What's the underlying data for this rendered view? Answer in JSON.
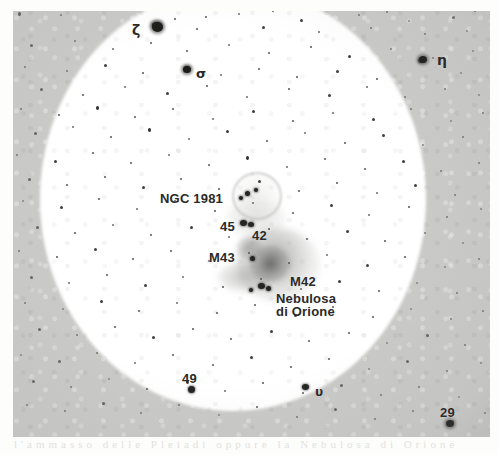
{
  "sheet": {
    "ghost_text": "l'ammasso  delle  Pleiadi   oppure   la  Nebulosa  di  Orione"
  },
  "plate": {
    "caption_labels": [
      {
        "id": "zeta",
        "text": "ζ",
        "x": 132,
        "y": 22,
        "kind": "greek-letter"
      },
      {
        "id": "sigma",
        "text": "σ",
        "x": 196,
        "y": 66,
        "kind": "greek-letter"
      },
      {
        "id": "eta",
        "text": "η",
        "x": 437,
        "y": 52,
        "kind": "greek-letter"
      },
      {
        "id": "ngc1981",
        "text": "NGC 1981",
        "x": 160,
        "y": 191,
        "kind": "object"
      },
      {
        "id": "s45",
        "text": "45",
        "x": 220,
        "y": 219,
        "kind": "star-number"
      },
      {
        "id": "s42",
        "text": "42",
        "x": 252,
        "y": 228,
        "kind": "star-number"
      },
      {
        "id": "m43",
        "text": "M43",
        "x": 209,
        "y": 250,
        "kind": "object"
      },
      {
        "id": "m42",
        "text": "M42",
        "x": 290,
        "y": 275,
        "kind": "object"
      },
      {
        "id": "m42sub1",
        "text": "Nebulosa",
        "x": 276,
        "y": 292,
        "kind": "object"
      },
      {
        "id": "m42sub2",
        "text": "di Orione",
        "x": 276,
        "y": 306,
        "kind": "object"
      },
      {
        "id": "upsilon",
        "text": "υ",
        "x": 315,
        "y": 385,
        "kind": "greek-letter"
      },
      {
        "id": "s49",
        "text": "49",
        "x": 182,
        "y": 371,
        "kind": "star-number"
      },
      {
        "id": "s29",
        "text": "29",
        "x": 440,
        "y": 405,
        "kind": "star-number"
      }
    ],
    "nebulae": [
      {
        "id": "m42-outer",
        "label": "M42 Nebulosa di Orione",
        "x": 236,
        "y": 228,
        "w": 84,
        "h": 74
      },
      {
        "id": "m42-core",
        "label": "M42 core",
        "x": 250,
        "y": 246,
        "w": 40,
        "h": 36
      },
      {
        "id": "m42-wing",
        "label": "M42 western wing",
        "x": 218,
        "y": 262,
        "w": 52,
        "h": 30
      },
      {
        "id": "m43",
        "label": "M43",
        "x": 236,
        "y": 236,
        "w": 26,
        "h": 24
      },
      {
        "id": "ngc1981-halo",
        "label": "NGC 1981 cluster halo",
        "x": 232,
        "y": 172,
        "w": 46,
        "h": 44
      },
      {
        "id": "running-man",
        "label": "NGC 1977 diffuse glow",
        "x": 226,
        "y": 198,
        "w": 60,
        "h": 40
      }
    ],
    "field_note": "Photographic plate of the Orion sword region, overexposed bright field"
  },
  "colors": {
    "sheet_background": "#fdfdfc",
    "plate_sky": "#c9c9c7",
    "bright_field": "#ffffff",
    "star_dark": "#1c1c1a",
    "label_text": "#2a2a28",
    "nebula_gray": "#8a8a88"
  },
  "stars": [
    [
      18,
      12,
      3,
      4
    ],
    [
      60,
      14,
      2,
      2
    ],
    [
      98,
      8,
      2,
      3
    ],
    [
      140,
      9,
      2,
      2
    ],
    [
      174,
      18,
      2,
      2
    ],
    [
      205,
      16,
      2,
      2
    ],
    [
      238,
      13,
      2,
      2
    ],
    [
      272,
      10,
      2,
      2
    ],
    [
      300,
      19,
      3,
      3
    ],
    [
      330,
      9,
      2,
      2
    ],
    [
      358,
      14,
      2,
      2
    ],
    [
      386,
      11,
      2,
      2
    ],
    [
      408,
      20,
      2,
      2
    ],
    [
      452,
      16,
      3,
      3
    ],
    [
      474,
      10,
      2,
      2
    ],
    [
      152,
      22,
      9,
      6
    ],
    [
      196,
      28,
      2,
      2
    ],
    [
      262,
      26,
      3,
      3
    ],
    [
      318,
      31,
      2,
      2
    ],
    [
      370,
      27,
      2,
      2
    ],
    [
      424,
      33,
      2,
      2
    ],
    [
      466,
      30,
      2,
      2
    ],
    [
      30,
      44,
      3,
      3
    ],
    [
      74,
      40,
      2,
      2
    ],
    [
      112,
      48,
      2,
      2
    ],
    [
      150,
      42,
      2,
      2
    ],
    [
      186,
      50,
      2,
      2
    ],
    [
      228,
      44,
      2,
      2
    ],
    [
      268,
      52,
      2,
      2
    ],
    [
      310,
      46,
      2,
      2
    ],
    [
      348,
      55,
      3,
      3
    ],
    [
      390,
      48,
      2,
      2
    ],
    [
      432,
      57,
      2,
      2
    ],
    [
      472,
      50,
      2,
      2
    ],
    [
      24,
      66,
      2,
      2
    ],
    [
      66,
      70,
      2,
      2
    ],
    [
      104,
      64,
      3,
      3
    ],
    [
      142,
      72,
      2,
      2
    ],
    [
      184,
      66,
      6,
      5
    ],
    [
      220,
      74,
      2,
      2
    ],
    [
      258,
      68,
      2,
      2
    ],
    [
      296,
      76,
      2,
      2
    ],
    [
      336,
      70,
      3,
      3
    ],
    [
      376,
      78,
      2,
      2
    ],
    [
      418,
      58,
      6,
      5
    ],
    [
      460,
      72,
      2,
      2
    ],
    [
      40,
      88,
      3,
      3
    ],
    [
      82,
      94,
      2,
      2
    ],
    [
      124,
      86,
      2,
      2
    ],
    [
      166,
      92,
      3,
      3
    ],
    [
      206,
      85,
      2,
      2
    ],
    [
      246,
      96,
      2,
      2
    ],
    [
      288,
      88,
      2,
      2
    ],
    [
      328,
      94,
      3,
      3
    ],
    [
      366,
      86,
      2,
      2
    ],
    [
      404,
      96,
      2,
      2
    ],
    [
      444,
      88,
      2,
      2
    ],
    [
      478,
      94,
      2,
      2
    ],
    [
      20,
      108,
      2,
      2
    ],
    [
      58,
      114,
      2,
      2
    ],
    [
      96,
      106,
      3,
      4
    ],
    [
      134,
      116,
      2,
      2
    ],
    [
      172,
      108,
      2,
      2
    ],
    [
      212,
      118,
      2,
      2
    ],
    [
      252,
      110,
      3,
      3
    ],
    [
      292,
      120,
      2,
      2
    ],
    [
      332,
      112,
      2,
      2
    ],
    [
      372,
      118,
      3,
      3
    ],
    [
      410,
      108,
      2,
      2
    ],
    [
      450,
      120,
      2,
      2
    ],
    [
      482,
      112,
      2,
      2
    ],
    [
      34,
      132,
      3,
      3
    ],
    [
      72,
      126,
      2,
      2
    ],
    [
      110,
      136,
      2,
      2
    ],
    [
      148,
      128,
      3,
      4
    ],
    [
      188,
      138,
      2,
      2
    ],
    [
      226,
      130,
      3,
      3
    ],
    [
      266,
      140,
      2,
      2
    ],
    [
      304,
      132,
      2,
      2
    ],
    [
      344,
      142,
      2,
      2
    ],
    [
      382,
      134,
      3,
      3
    ],
    [
      422,
      144,
      2,
      2
    ],
    [
      462,
      136,
      2,
      2
    ],
    [
      16,
      154,
      2,
      2
    ],
    [
      54,
      160,
      3,
      3
    ],
    [
      92,
      152,
      2,
      2
    ],
    [
      130,
      162,
      2,
      2
    ],
    [
      168,
      154,
      2,
      2
    ],
    [
      208,
      164,
      2,
      2
    ],
    [
      246,
      156,
      3,
      4
    ],
    [
      286,
      166,
      2,
      2
    ],
    [
      324,
      158,
      2,
      2
    ],
    [
      364,
      168,
      2,
      2
    ],
    [
      402,
      160,
      3,
      3
    ],
    [
      440,
      170,
      2,
      2
    ],
    [
      478,
      162,
      2,
      2
    ],
    [
      28,
      178,
      3,
      3
    ],
    [
      66,
      184,
      2,
      2
    ],
    [
      104,
      176,
      2,
      2
    ],
    [
      142,
      186,
      3,
      3
    ],
    [
      180,
      178,
      2,
      2
    ],
    [
      218,
      188,
      2,
      2
    ],
    [
      258,
      180,
      3,
      3
    ],
    [
      298,
      190,
      2,
      2
    ],
    [
      336,
      182,
      2,
      2
    ],
    [
      376,
      192,
      2,
      2
    ],
    [
      414,
      184,
      3,
      3
    ],
    [
      454,
      194,
      2,
      2
    ],
    [
      22,
      200,
      2,
      2
    ],
    [
      60,
      206,
      3,
      3
    ],
    [
      98,
      198,
      2,
      2
    ],
    [
      136,
      208,
      2,
      2
    ],
    [
      174,
      200,
      2,
      2
    ],
    [
      214,
      210,
      2,
      2
    ],
    [
      252,
      202,
      2,
      2
    ],
    [
      292,
      212,
      2,
      2
    ],
    [
      330,
      204,
      3,
      3
    ],
    [
      368,
      214,
      2,
      2
    ],
    [
      408,
      206,
      2,
      2
    ],
    [
      446,
      216,
      2,
      2
    ],
    [
      480,
      208,
      2,
      2
    ],
    [
      36,
      226,
      3,
      3
    ],
    [
      74,
      232,
      2,
      2
    ],
    [
      112,
      224,
      2,
      2
    ],
    [
      150,
      234,
      2,
      2
    ],
    [
      190,
      226,
      3,
      3
    ],
    [
      228,
      236,
      2,
      2
    ],
    [
      268,
      228,
      2,
      2
    ],
    [
      306,
      238,
      2,
      2
    ],
    [
      346,
      230,
      3,
      3
    ],
    [
      384,
      240,
      2,
      2
    ],
    [
      424,
      232,
      2,
      2
    ],
    [
      462,
      242,
      2,
      2
    ],
    [
      18,
      250,
      2,
      2
    ],
    [
      56,
      256,
      2,
      2
    ],
    [
      94,
      248,
      3,
      3
    ],
    [
      132,
      258,
      2,
      2
    ],
    [
      170,
      250,
      2,
      2
    ],
    [
      208,
      260,
      2,
      2
    ],
    [
      248,
      252,
      2,
      2
    ],
    [
      288,
      262,
      2,
      2
    ],
    [
      326,
      254,
      2,
      2
    ],
    [
      366,
      264,
      3,
      3
    ],
    [
      404,
      256,
      2,
      2
    ],
    [
      444,
      266,
      2,
      2
    ],
    [
      478,
      258,
      2,
      2
    ],
    [
      30,
      276,
      3,
      3
    ],
    [
      68,
      282,
      2,
      2
    ],
    [
      106,
      274,
      2,
      2
    ],
    [
      144,
      284,
      3,
      3
    ],
    [
      182,
      276,
      2,
      2
    ],
    [
      222,
      286,
      2,
      2
    ],
    [
      260,
      278,
      2,
      2
    ],
    [
      300,
      288,
      2,
      2
    ],
    [
      338,
      280,
      3,
      3
    ],
    [
      378,
      290,
      2,
      2
    ],
    [
      416,
      282,
      2,
      2
    ],
    [
      456,
      292,
      2,
      2
    ],
    [
      24,
      302,
      2,
      2
    ],
    [
      62,
      308,
      2,
      2
    ],
    [
      100,
      300,
      3,
      3
    ],
    [
      138,
      310,
      2,
      2
    ],
    [
      176,
      302,
      2,
      2
    ],
    [
      216,
      312,
      2,
      2
    ],
    [
      254,
      304,
      2,
      2
    ],
    [
      294,
      314,
      3,
      3
    ],
    [
      332,
      306,
      2,
      2
    ],
    [
      372,
      316,
      2,
      2
    ],
    [
      410,
      308,
      2,
      2
    ],
    [
      450,
      318,
      2,
      2
    ],
    [
      482,
      310,
      2,
      2
    ],
    [
      38,
      328,
      3,
      3
    ],
    [
      76,
      334,
      2,
      2
    ],
    [
      114,
      326,
      2,
      2
    ],
    [
      152,
      336,
      3,
      3
    ],
    [
      192,
      328,
      2,
      2
    ],
    [
      230,
      338,
      2,
      2
    ],
    [
      270,
      330,
      3,
      3
    ],
    [
      308,
      340,
      2,
      2
    ],
    [
      348,
      332,
      2,
      2
    ],
    [
      386,
      342,
      2,
      2
    ],
    [
      426,
      334,
      3,
      3
    ],
    [
      464,
      344,
      2,
      2
    ],
    [
      20,
      354,
      2,
      2
    ],
    [
      58,
      360,
      3,
      3
    ],
    [
      96,
      352,
      2,
      2
    ],
    [
      134,
      362,
      2,
      2
    ],
    [
      172,
      354,
      2,
      2
    ],
    [
      212,
      364,
      2,
      2
    ],
    [
      250,
      356,
      3,
      3
    ],
    [
      290,
      366,
      2,
      2
    ],
    [
      328,
      358,
      2,
      2
    ],
    [
      368,
      368,
      2,
      2
    ],
    [
      406,
      360,
      3,
      3
    ],
    [
      446,
      370,
      2,
      2
    ],
    [
      480,
      362,
      2,
      2
    ],
    [
      32,
      380,
      3,
      3
    ],
    [
      70,
      386,
      2,
      2
    ],
    [
      108,
      378,
      2,
      2
    ],
    [
      146,
      388,
      2,
      2
    ],
    [
      186,
      380,
      3,
      4
    ],
    [
      224,
      390,
      2,
      2
    ],
    [
      262,
      382,
      2,
      2
    ],
    [
      302,
      392,
      2,
      2
    ],
    [
      340,
      384,
      3,
      3
    ],
    [
      380,
      394,
      2,
      2
    ],
    [
      418,
      386,
      2,
      2
    ],
    [
      458,
      396,
      2,
      2
    ],
    [
      26,
      404,
      2,
      2
    ],
    [
      64,
      410,
      2,
      2
    ],
    [
      102,
      402,
      3,
      3
    ],
    [
      140,
      412,
      2,
      2
    ],
    [
      178,
      404,
      2,
      2
    ],
    [
      218,
      414,
      2,
      2
    ],
    [
      256,
      406,
      2,
      2
    ],
    [
      296,
      416,
      2,
      2
    ],
    [
      334,
      408,
      3,
      3
    ],
    [
      374,
      418,
      2,
      2
    ],
    [
      412,
      410,
      2,
      2
    ],
    [
      452,
      420,
      2,
      2
    ],
    [
      484,
      412,
      2,
      2
    ]
  ]
}
